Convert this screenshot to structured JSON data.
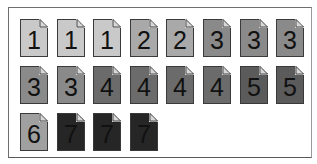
{
  "diagram": {
    "title": "",
    "rows": [
      [
        {
          "label": "1",
          "color": "#c9c9c9"
        },
        {
          "label": "1",
          "color": "#c9c9c9"
        },
        {
          "label": "1",
          "color": "#c9c9c9"
        },
        {
          "label": "2",
          "color": "#a9a9a9"
        },
        {
          "label": "2",
          "color": "#a9a9a9"
        },
        {
          "label": "3",
          "color": "#8a8a8a"
        },
        {
          "label": "3",
          "color": "#8a8a8a"
        },
        {
          "label": "3",
          "color": "#8a8a8a"
        }
      ],
      [
        {
          "label": "3",
          "color": "#8a8a8a"
        },
        {
          "label": "3",
          "color": "#8a8a8a"
        },
        {
          "label": "4",
          "color": "#6b6b6b"
        },
        {
          "label": "4",
          "color": "#6b6b6b"
        },
        {
          "label": "4",
          "color": "#6b6b6b"
        },
        {
          "label": "4",
          "color": "#6b6b6b"
        },
        {
          "label": "5",
          "color": "#5b5b5b"
        },
        {
          "label": "5",
          "color": "#5b5b5b"
        }
      ],
      [
        {
          "label": "6",
          "color": "#a0a0a0"
        },
        {
          "label": "7",
          "color": "#262626"
        },
        {
          "label": "7",
          "color": "#262626"
        },
        {
          "label": "7",
          "color": "#262626"
        }
      ]
    ]
  }
}
